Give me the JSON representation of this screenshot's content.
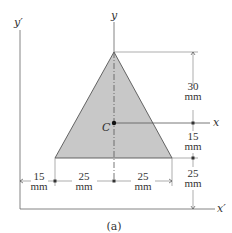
{
  "figure": {
    "caption": "(a)",
    "shape": "triangle",
    "fill_color": "#c8c8c8",
    "stroke_color": "#555555",
    "axes": {
      "y_prime": "y′",
      "x_prime": "x′",
      "y": "y",
      "x": "x"
    },
    "centroid_label": "C",
    "dimensions": {
      "right": [
        {
          "value": "30",
          "unit": "mm"
        },
        {
          "value": "15",
          "unit": "mm"
        },
        {
          "value": "25",
          "unit": "mm"
        }
      ],
      "bottom": [
        {
          "value": "15",
          "unit": "mm"
        },
        {
          "value": "25",
          "unit": "mm"
        },
        {
          "value": "25",
          "unit": "mm"
        }
      ]
    }
  }
}
